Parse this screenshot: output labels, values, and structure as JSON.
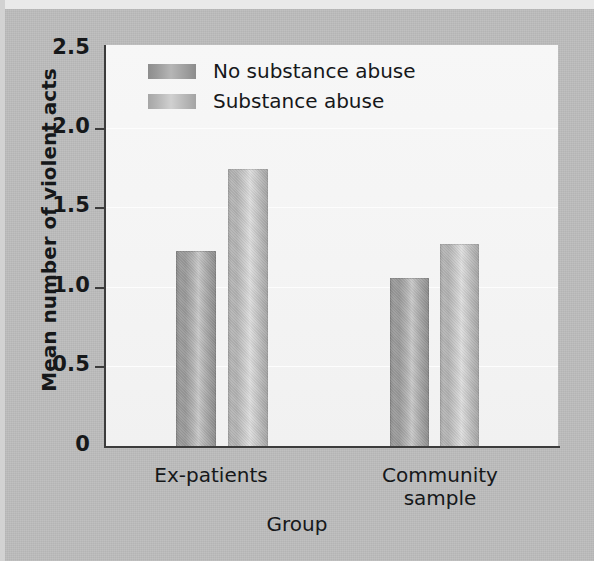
{
  "chart_data": {
    "type": "bar",
    "title": "",
    "xlabel": "Group",
    "ylabel": "Mean number of violent acts",
    "categories": [
      "Ex-patients",
      "Community sample"
    ],
    "category_labels_multiline": [
      [
        "Ex-patients"
      ],
      [
        "Community",
        "sample"
      ]
    ],
    "series": [
      {
        "name": "No substance abuse",
        "values": [
          1.22,
          1.05
        ],
        "color": "#9a9a9a"
      },
      {
        "name": "Substance abuse",
        "values": [
          1.73,
          1.26
        ],
        "color": "#c0c0c0"
      }
    ],
    "ylim": [
      0,
      2.5
    ],
    "yticks": [
      0,
      0.5,
      1.0,
      1.5,
      2.0,
      2.5
    ],
    "ytick_labels": [
      "0",
      "0.5",
      "1.0",
      "1.5",
      "2.0",
      "2.5"
    ],
    "grid": true,
    "grid_axis": "y",
    "legend_position": "top-left",
    "bar_style": "cylindrical-gradient-grayscale"
  },
  "axes": {
    "y_title": "Mean number of violent acts",
    "x_title": "Group",
    "y_labels": [
      "2.5",
      "2.0",
      "1.5",
      "1.0",
      "0.5",
      "0"
    ]
  },
  "legend": {
    "items": [
      {
        "label": "No substance abuse",
        "swatch": "dark-gray-gradient"
      },
      {
        "label": "Substance abuse",
        "swatch": "light-gray-gradient"
      }
    ]
  },
  "xlabels": {
    "group1_line1": "Ex-patients",
    "group2_line1": "Community",
    "group2_line2": "sample"
  },
  "colors": {
    "page_background": "#bcbcbc",
    "plot_background": "#f6f6f6",
    "axis": "#3c3c3c",
    "text": "#16181a",
    "bar_dark": "#9a9a9a",
    "bar_light": "#c0c0c0"
  }
}
